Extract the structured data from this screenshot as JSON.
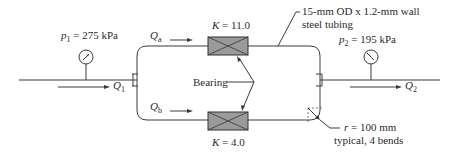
{
  "diagram": {
    "type": "pipe-network",
    "inlet_pressure": {
      "symbol": "p",
      "subscript": "1",
      "value": " = 275 kPa"
    },
    "outlet_pressure": {
      "symbol": "p",
      "subscript": "2",
      "value": " = 195 kPa"
    },
    "flows": {
      "Q1": {
        "symbol": "Q",
        "subscript": "1"
      },
      "Q2": {
        "symbol": "Q",
        "subscript": "2"
      },
      "Qa": {
        "symbol": "Q",
        "subscript": "a"
      },
      "Qb": {
        "symbol": "Q",
        "subscript": "b"
      }
    },
    "upper_bearing": {
      "label_K": "K",
      "value": " = 11.0"
    },
    "lower_bearing": {
      "label_K": "K",
      "value": " = 4.0"
    },
    "bearing_label": "Bearing",
    "tubing_note": {
      "line1": "15-mm OD x 1.2-mm wall",
      "line2": "steel tubing"
    },
    "bend_note": {
      "symbol": "r",
      "line1_value": " = 100 mm",
      "line2": "typical, 4 bends"
    }
  }
}
